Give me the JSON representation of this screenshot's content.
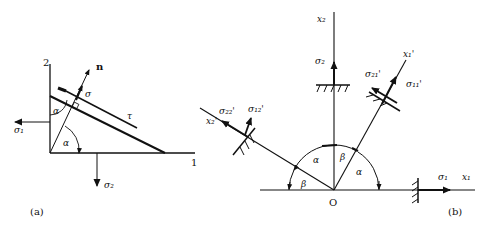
{
  "figure": {
    "panel_a": {
      "label": "(a)",
      "axis_vertical_label": "2",
      "axis_horizontal_label": "1",
      "normal_label": "n",
      "normal_stress_label": "σ",
      "shear_stress_label": "τ",
      "stress_1_label": "σ₁",
      "stress_2_label": "σ₂",
      "angle_label_top": "α",
      "angle_label_bottom": "α"
    },
    "panel_b": {
      "label": "(b)",
      "origin_label": "O",
      "axis_x1_label": "x₁",
      "axis_x2_label": "x₂",
      "axis_x1_prime_label": "x₁'",
      "axis_x2_prime_label": "x₂'",
      "stress_1_label": "σ₁",
      "stress_2_label": "σ₂",
      "stress_11_prime_label": "σ₁₁'",
      "stress_21_prime_label": "σ₂₁'",
      "stress_22_prime_label": "σ₂₂'",
      "stress_12_prime_label": "σ₁₂'",
      "angle_alpha_left": "α",
      "angle_beta_left": "β",
      "angle_beta_right": "β",
      "angle_alpha_right": "α"
    }
  }
}
